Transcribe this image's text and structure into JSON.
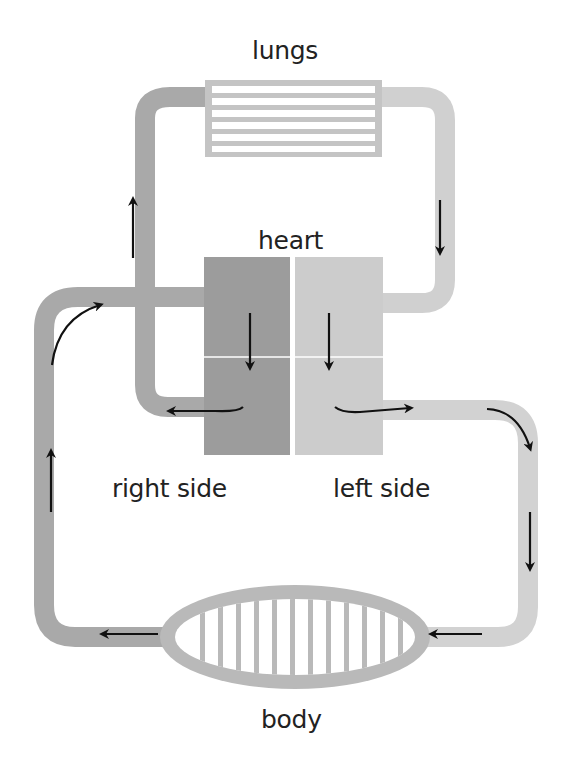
{
  "diagram": {
    "labels": {
      "lungs": "lungs",
      "heart": "heart",
      "right_side": "right side",
      "left_side": "left side",
      "body": "body"
    },
    "nodes": [
      {
        "id": "lungs",
        "label": "lungs",
        "shape": "striped-box",
        "stripes": 6
      },
      {
        "id": "heart-right",
        "label": "right side",
        "shape": "rect",
        "chambers": 2,
        "color": "#9c9c9c"
      },
      {
        "id": "heart-left",
        "label": "left side",
        "shape": "rect",
        "chambers": 2,
        "color": "#cccccc"
      },
      {
        "id": "body",
        "label": "body",
        "shape": "striped-ellipse",
        "stripes": 12
      }
    ],
    "edges": [
      {
        "from": "heart-right",
        "to": "lungs",
        "direction": "up",
        "tube_color": "#a9a9a9"
      },
      {
        "from": "lungs",
        "to": "heart-left",
        "direction": "down",
        "tube_color": "#d0d0d0"
      },
      {
        "from": "heart-left",
        "to": "body",
        "direction": "right-then-down",
        "tube_color": "#d2d2d2"
      },
      {
        "from": "body",
        "to": "heart-right",
        "direction": "left-then-up",
        "tube_color": "#a9a9a9"
      }
    ],
    "colors": {
      "deoxygenated_tube": "#a9a9a9",
      "oxygenated_tube": "#d0d0d0",
      "right_chamber": "#9c9c9c",
      "left_chamber": "#cccccc",
      "arrow": "#111111",
      "text": "#222222",
      "background": "#ffffff"
    }
  }
}
